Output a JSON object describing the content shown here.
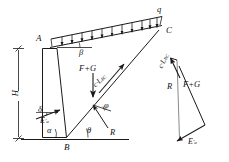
{
  "figure": {
    "type": "engineering-diagram",
    "stroke_color": "#1a1a1a",
    "background_color": "#ffffff"
  },
  "labels": {
    "point_a": "A",
    "point_b": "B",
    "point_c": "C",
    "surcharge_q": "q",
    "backfill_slope_beta": "β",
    "wall_back_angle_alpha": "α",
    "failure_plane_theta": "θ",
    "friction_angle_phi": "φ",
    "wall_friction_delta": "δ",
    "wall_height_h": "H",
    "weight_force": "F+G",
    "cohesion_force": "c·L",
    "cohesion_force_sub": "BC",
    "reaction_force": "R",
    "active_thrust": "E",
    "active_thrust_sub": "a",
    "active_thrust_prime": "′"
  },
  "diagram_elements": {
    "wall": {
      "name": "retaining-wall",
      "top_left": [
        42,
        48
      ],
      "top_right": [
        57,
        48
      ],
      "bottom_left": [
        42,
        137
      ],
      "bottom_right": [
        66,
        137
      ]
    },
    "backfill_surface": {
      "name": "backfill-slope-line",
      "from": [
        50,
        47
      ],
      "to": [
        160,
        26
      ]
    },
    "failure_plane": {
      "name": "failure-plane-bc",
      "from": [
        66,
        137
      ],
      "to": [
        158,
        31
      ]
    },
    "surcharge": {
      "name": "distributed-load-q",
      "arrow_count": 11,
      "top_line_from": [
        52,
        39
      ],
      "top_line_to": [
        161,
        17
      ]
    },
    "ground_line": {
      "name": "ground-surface-line",
      "from": [
        20,
        139
      ],
      "to": [
        128,
        139
      ]
    },
    "dimension_line": {
      "name": "height-dimension-h",
      "x": 18,
      "top": 48,
      "bottom": 139
    }
  },
  "force_polygon": {
    "name": "force-polygon",
    "vertices": {
      "top": [
        175,
        57
      ],
      "upper_mid": [
        180,
        72
      ],
      "lower_right": [
        205,
        125
      ],
      "bottom": [
        178,
        140
      ]
    },
    "members": [
      {
        "name": "cohesion-vector",
        "label": "c·L BC"
      },
      {
        "name": "reaction-vector",
        "label": "R"
      },
      {
        "name": "weight-vector",
        "label": "F+G"
      },
      {
        "name": "active-thrust-vector",
        "label": "E′a"
      }
    ]
  }
}
